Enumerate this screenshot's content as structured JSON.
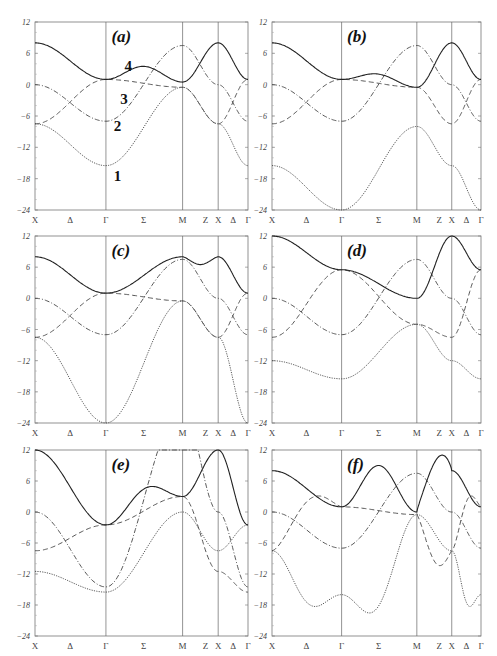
{
  "figure": {
    "ylim": [
      -24,
      12
    ],
    "yticks": [
      "12",
      "6",
      "0",
      "-6",
      "-12",
      "-18",
      "-24"
    ],
    "xticks": [
      "X",
      "Δ",
      "Γ",
      "Σ",
      "M",
      "Z",
      "X",
      "Δ",
      "Γ"
    ],
    "band_labels": [
      "1",
      "2",
      "3",
      "4"
    ]
  },
  "chart_data": [
    {
      "panel": "(a)",
      "type": "line",
      "ylim": [
        -24,
        12
      ],
      "x_points": [
        "X",
        "Γ",
        "M",
        "X",
        "Γ"
      ],
      "vlines_at": [
        "Γ",
        "M",
        "X"
      ],
      "series": [
        {
          "name": "1",
          "style": "dotted",
          "values": [
            -7.5,
            -15.5,
            -0.5,
            -7.5,
            -15.5
          ]
        },
        {
          "name": "2",
          "style": "dash-dot",
          "values": [
            0,
            -7,
            7.5,
            0,
            -7
          ]
        },
        {
          "name": "3",
          "style": "dashed",
          "values": [
            -7.5,
            1,
            -0.5,
            -7.5,
            1
          ]
        },
        {
          "name": "4",
          "style": "solid",
          "values": [
            8,
            1,
            0.5,
            8,
            1
          ],
          "peak_sigma": 3.5
        }
      ]
    },
    {
      "panel": "(b)",
      "type": "line",
      "ylim": [
        -24,
        12
      ],
      "series": [
        {
          "name": "1",
          "style": "dotted",
          "values": [
            -15.5,
            -24,
            -8,
            -15.5,
            -24
          ]
        },
        {
          "name": "2",
          "style": "dash-dot",
          "values": [
            0,
            -7,
            7.5,
            0,
            -7
          ]
        },
        {
          "name": "3",
          "style": "dashed",
          "values": [
            -7.5,
            1,
            -0.5,
            -7.5,
            1
          ]
        },
        {
          "name": "4",
          "style": "solid",
          "values": [
            8,
            1,
            -0.5,
            8,
            1
          ],
          "peak_sigma": 2
        }
      ]
    },
    {
      "panel": "(c)",
      "type": "line",
      "ylim": [
        -24,
        12
      ],
      "series": [
        {
          "name": "1",
          "style": "dotted",
          "values": [
            -7.5,
            -24,
            -0.5,
            -7.5,
            -24
          ]
        },
        {
          "name": "2",
          "style": "dash-dot",
          "values": [
            0,
            -7,
            7.5,
            0,
            -7
          ]
        },
        {
          "name": "3",
          "style": "dashed",
          "values": [
            -7.5,
            1,
            -0.5,
            -7.5,
            1
          ]
        },
        {
          "name": "4",
          "style": "solid",
          "values": [
            8,
            1,
            8,
            8,
            1
          ],
          "dip_z": 6.5
        }
      ]
    },
    {
      "panel": "(d)",
      "type": "line",
      "ylim": [
        -24,
        12
      ],
      "series": [
        {
          "name": "1",
          "style": "dotted",
          "values": [
            -12,
            -15.5,
            -5,
            -12,
            -15.5
          ]
        },
        {
          "name": "2",
          "style": "dash-dot",
          "values": [
            0,
            -7,
            7.5,
            0,
            -7
          ]
        },
        {
          "name": "3",
          "style": "dashed",
          "values": [
            -7.5,
            5.5,
            -5,
            -7.5,
            5.5
          ]
        },
        {
          "name": "4",
          "style": "solid",
          "values": [
            12,
            5.5,
            0,
            12,
            5.5
          ]
        }
      ]
    },
    {
      "panel": "(e)",
      "type": "line",
      "ylim": [
        -24,
        12
      ],
      "series": [
        {
          "name": "1",
          "style": "dotted",
          "values": [
            -11.5,
            -15.5,
            0,
            -7.5,
            -2.5
          ]
        },
        {
          "name": "2",
          "style": "dash-dot",
          "values": [
            0,
            -14.5,
            20,
            0,
            -14.5
          ]
        },
        {
          "name": "3",
          "style": "dashed",
          "values": [
            -7.5,
            -2.5,
            3,
            -11.5,
            -15.5
          ]
        },
        {
          "name": "4",
          "style": "solid",
          "values": [
            12,
            -2.5,
            3,
            12,
            -2.5
          ],
          "peak_sigma": 4.5
        }
      ]
    },
    {
      "panel": "(f)",
      "type": "line",
      "ylim": [
        -24,
        12
      ],
      "series": [
        {
          "name": "1",
          "style": "dotted",
          "values": [
            -7.5,
            -16,
            -0.5,
            -7.5,
            -16
          ],
          "min_delta": -17.5,
          "min_sigma": -18
        },
        {
          "name": "2",
          "style": "dash-dot",
          "values": [
            0,
            -7,
            7.5,
            0,
            -7
          ]
        },
        {
          "name": "3",
          "style": "dashed",
          "values": [
            -7.5,
            1,
            -0.5,
            -7.5,
            1
          ],
          "max_delta": 2,
          "min_z": -9.5
        },
        {
          "name": "4",
          "style": "solid",
          "values": [
            8,
            1,
            0,
            8,
            1
          ],
          "peak_sigma": 9,
          "peak_z": 9.5
        }
      ]
    }
  ],
  "panels": [
    {
      "label": "(a)",
      "x": 35,
      "y": 22,
      "w": 213,
      "h": 188
    },
    {
      "label": "(b)",
      "x": 272,
      "y": 22,
      "w": 209,
      "h": 188
    },
    {
      "label": "(c)",
      "x": 35,
      "y": 236,
      "w": 213,
      "h": 187
    },
    {
      "label": "(d)",
      "x": 272,
      "y": 236,
      "w": 209,
      "h": 187
    },
    {
      "label": "(e)",
      "x": 35,
      "y": 450,
      "w": 213,
      "h": 186
    },
    {
      "label": "(f)",
      "x": 272,
      "y": 450,
      "w": 209,
      "h": 186
    }
  ]
}
